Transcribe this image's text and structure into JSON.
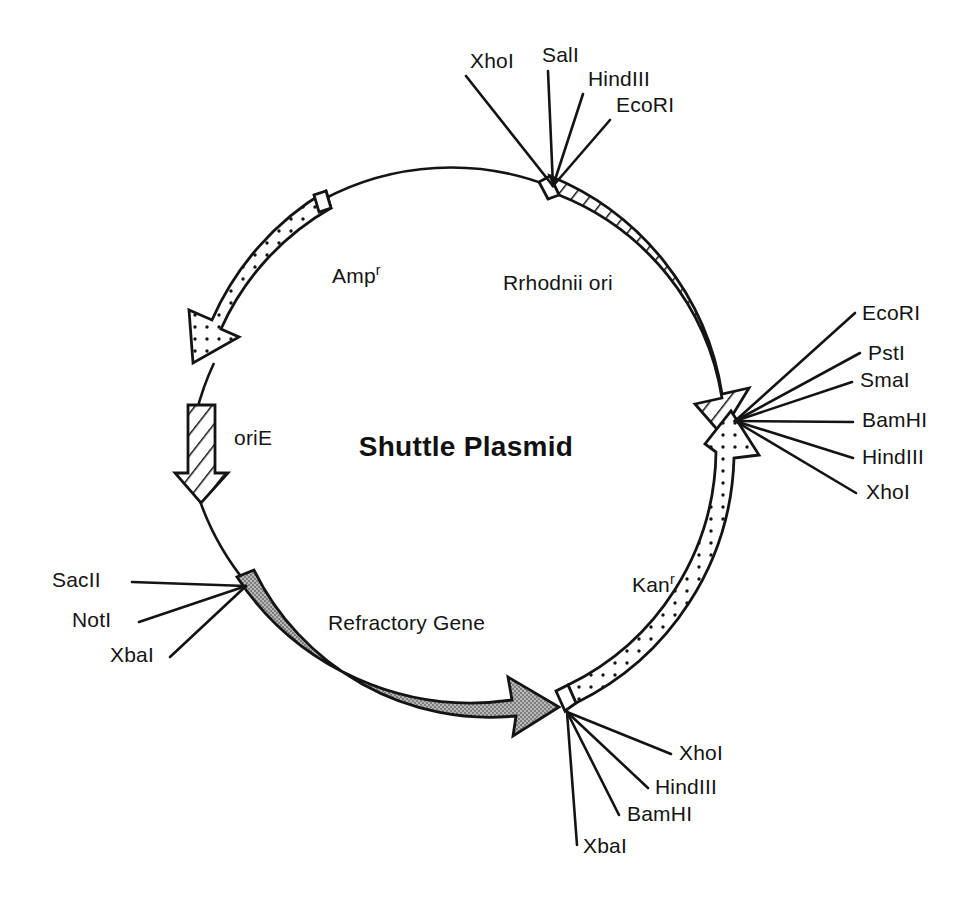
{
  "figure": {
    "kind": "plasmid-map",
    "title": "Shuttle Plasmid",
    "background_color": "#ffffff",
    "line_color": "#141414"
  },
  "plasmid": {
    "center": {
      "x": 466,
      "y": 447
    },
    "radius": 272,
    "title": "Shuttle Plasmid"
  },
  "features": [
    {
      "id": "rrhodnii-ori",
      "label": "Rrhodnii ori",
      "fill_style": "hatched",
      "fill_color": "#ffffff",
      "label_x": 503,
      "label_y": 290,
      "start_angle_deg": -72,
      "end_angle_deg": -6,
      "direction": "clockwise"
    },
    {
      "id": "kan-r",
      "label": "Kan",
      "superscript": "r",
      "fill_style": "dotted",
      "fill_color": "#ffffff",
      "label_x": 632,
      "label_y": 592,
      "start_angle_deg": 76,
      "end_angle_deg": 2,
      "direction": "counterclockwise"
    },
    {
      "id": "refractory-gene",
      "label": "Refractory Gene",
      "fill_style": "solid-gray",
      "fill_color": "#9e9e9e",
      "label_x": 328,
      "label_y": 630,
      "start_angle_deg": 180,
      "end_angle_deg": 103,
      "direction": "clockwise"
    },
    {
      "id": "amp-r",
      "label": "Amp",
      "superscript": "r",
      "fill_style": "dotted",
      "fill_color": "#ffffff",
      "label_x": 332,
      "label_y": 283,
      "start_angle_deg": -109,
      "end_angle_deg": -159,
      "direction": "counterclockwise"
    },
    {
      "id": "orie",
      "label": "oriE",
      "fill_style": "hatched",
      "fill_color": "#ffffff",
      "label_x": 234,
      "label_y": 445,
      "start_angle_deg": -174,
      "end_angle_deg": -186,
      "direction": "counterclockwise"
    }
  ],
  "restriction_sites": {
    "top_cluster": {
      "anchor": {
        "x": 553,
        "y": 186
      },
      "sites": [
        {
          "name": "XhoI",
          "text_x": 470,
          "text_y": 68,
          "anchor": "start",
          "line_x": 466,
          "line_y": 76
        },
        {
          "name": "SalI",
          "text_x": 542,
          "text_y": 62,
          "anchor": "start",
          "line_x": 548,
          "line_y": 71
        },
        {
          "name": "HindIII",
          "text_x": 588,
          "text_y": 86,
          "anchor": "start",
          "line_x": 583,
          "line_y": 94
        },
        {
          "name": "EcoRI",
          "text_x": 616,
          "text_y": 112,
          "anchor": "start",
          "line_x": 610,
          "line_y": 120
        }
      ]
    },
    "right_cluster": {
      "anchor": {
        "x": 735,
        "y": 421
      },
      "sites": [
        {
          "name": "EcoRI",
          "text_x": 862,
          "text_y": 320,
          "anchor": "start",
          "line_x": 855,
          "line_y": 313
        },
        {
          "name": "PstI",
          "text_x": 868,
          "text_y": 360,
          "anchor": "start",
          "line_x": 860,
          "line_y": 353
        },
        {
          "name": "SmaI",
          "text_x": 860,
          "text_y": 387,
          "anchor": "start",
          "line_x": 852,
          "line_y": 382
        },
        {
          "name": "BamHI",
          "text_x": 862,
          "text_y": 427,
          "anchor": "start",
          "line_x": 853,
          "line_y": 422
        },
        {
          "name": "HindIII",
          "text_x": 862,
          "text_y": 464,
          "anchor": "start",
          "line_x": 853,
          "line_y": 458
        },
        {
          "name": "XhoI",
          "text_x": 866,
          "text_y": 499,
          "anchor": "start",
          "line_x": 856,
          "line_y": 493
        }
      ]
    },
    "bottom_cluster": {
      "anchor": {
        "x": 567,
        "y": 712
      },
      "sites": [
        {
          "name": "XhoI",
          "text_x": 679,
          "text_y": 760,
          "anchor": "start",
          "line_x": 671,
          "line_y": 754
        },
        {
          "name": "HindIII",
          "text_x": 655,
          "text_y": 794,
          "anchor": "start",
          "line_x": 648,
          "line_y": 788
        },
        {
          "name": "BamHI",
          "text_x": 627,
          "text_y": 821,
          "anchor": "start",
          "line_x": 619,
          "line_y": 815
        },
        {
          "name": "XbaI",
          "text_x": 583,
          "text_y": 853,
          "anchor": "start",
          "line_x": 577,
          "line_y": 845
        }
      ]
    },
    "left_cluster": {
      "anchor": {
        "x": 246,
        "y": 586
      },
      "sites": [
        {
          "name": "SacII",
          "text_x": 52,
          "text_y": 587,
          "anchor": "start",
          "line_x": 132,
          "line_y": 582
        },
        {
          "name": "NotI",
          "text_x": 72,
          "text_y": 627,
          "anchor": "start",
          "line_x": 139,
          "line_y": 622
        },
        {
          "name": "XbaI",
          "text_x": 110,
          "text_y": 662,
          "anchor": "start",
          "line_x": 170,
          "line_y": 657
        }
      ]
    }
  }
}
